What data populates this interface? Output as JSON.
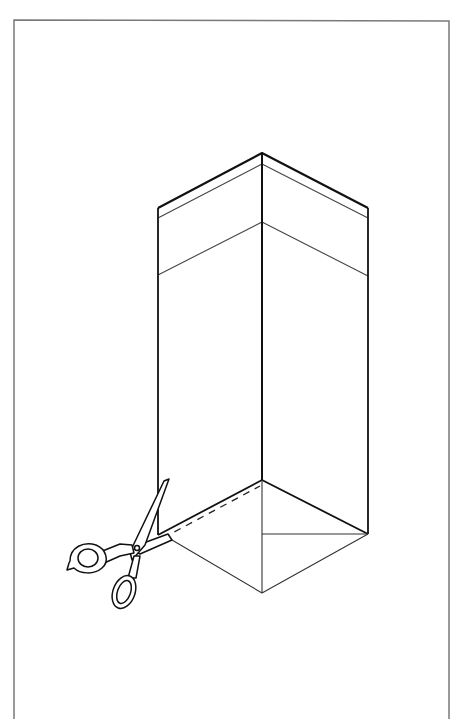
{
  "figure": {
    "colors": {
      "background": "#ffffff",
      "frame": "#7a7a7a",
      "stroke": "#111111",
      "thin_stroke": "#444444"
    }
  }
}
